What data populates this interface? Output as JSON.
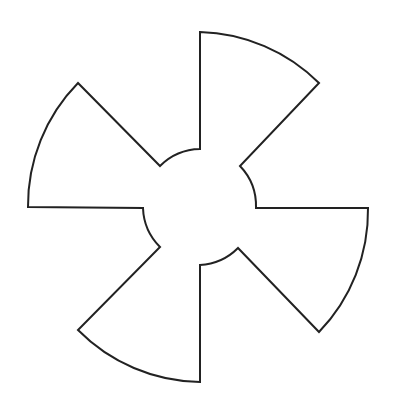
{
  "diagram": {
    "shape": "four-blade-propeller",
    "stroke_color": "#222222",
    "fill_color": "#ffffff",
    "background": "#ffffff",
    "blades": 4,
    "center": [
      200,
      207
    ],
    "inner_radius": 58,
    "outer_radius": 175
  }
}
